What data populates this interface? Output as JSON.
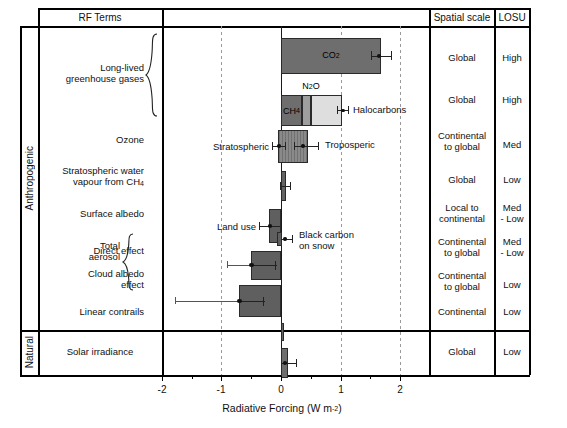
{
  "figure": {
    "columns": {
      "rf_terms": "RF Terms",
      "spatial_scale": "Spatial scale",
      "losu": "LOSU"
    },
    "group_labels": {
      "anthropogenic": "Anthropogenic",
      "natural": "Natural"
    },
    "brace_labels": {
      "llghg": "Long-lived\ngreenhouse gases",
      "llghg_line1": "Long-lived",
      "llghg_line2": "greenhouse gases",
      "total_aerosol_line1": "Total",
      "total_aerosol_line2": "aerosol"
    },
    "axis": {
      "title_main": "Radiative Forcing (W m",
      "title_exp": "-2",
      "title_close": ")",
      "tick_labels": [
        "-2",
        "-1",
        "0",
        "1",
        "2"
      ],
      "tick_values": [
        -2,
        -1,
        0,
        1,
        2
      ],
      "xlim": [
        -2.4,
        2.45
      ],
      "gridlines": [
        -1,
        1,
        2
      ]
    }
  },
  "chart_data": {
    "type": "bar",
    "orientation": "horizontal",
    "title": "",
    "xlabel": "Radiative Forcing (W m-2)",
    "ylabel": "RF Terms",
    "xlim": [
      -2.4,
      2.45
    ],
    "grid": true,
    "legend": "none",
    "rows": [
      {
        "id": "co2",
        "term": "Long-lived greenhouse gases",
        "bar_label": "CO2",
        "bar_label_html": "CO<sub>2</sub>",
        "value": 1.66,
        "err_low": 1.49,
        "err_high": 1.83,
        "err_center": 1.57,
        "spatial_scale": "Global",
        "losu": "High",
        "color": "#6e6e6e"
      },
      {
        "id": "ch4_n2o_halocarbons",
        "term": "Long-lived greenhouse gases",
        "stacked": true,
        "segments": [
          {
            "name": "CH4",
            "label_html": "CH<sub>4</sub>",
            "value": 0.48,
            "color": "#6e6e6e"
          },
          {
            "name": "N2O",
            "label_html": "N<sub>2</sub>O",
            "value": 0.16,
            "color": "#9e9e9e"
          },
          {
            "name": "Halocarbons",
            "label_html": "Halocarbons",
            "value": 0.34,
            "color": "#dedede"
          }
        ],
        "total": 0.98,
        "err_low": 0.92,
        "err_high": 1.12,
        "err_center": 1.02,
        "spatial_scale": "Global",
        "losu": "High"
      },
      {
        "id": "ozone",
        "term": "Ozone",
        "value_low": -0.05,
        "value_high": 0.35,
        "labels": [
          "Stratospheric",
          "Troposperic"
        ],
        "strat_value": -0.05,
        "strat_err_low": -0.15,
        "strat_err_high": 0.05,
        "trop_value": 0.35,
        "trop_err_low": 0.25,
        "trop_err_high": 0.65,
        "spatial_scale": "Continental\nto global",
        "spatial_scale_line1": "Continental",
        "spatial_scale_line2": "to global",
        "losu": "Med"
      },
      {
        "id": "strat_water_vapour",
        "term": "Stratospheric water vapour from CH4",
        "term_line1": "Stratospheric water",
        "term_line2_html": "vapour from CH<sub>4</sub>",
        "value": 0.07,
        "err_low": 0.02,
        "err_high": 0.12,
        "spatial_scale": "Global",
        "losu": "Low"
      },
      {
        "id": "surface_albedo",
        "term": "Surface albedo",
        "labels": [
          "Land use",
          "Black carbon on snow"
        ],
        "label2_line1": "Black carbon",
        "label2_line2": "on snow",
        "land_use_value": -0.2,
        "land_use_err_low": -0.4,
        "land_use_err_high": 0.0,
        "bc_snow_value": 0.1,
        "bc_snow_err_low": 0.0,
        "bc_snow_err_high": 0.2,
        "spatial_scale": "Local to\ncontinental",
        "spatial_scale_line1": "Local to",
        "spatial_scale_line2": "continental",
        "losu": "Med\n- Low",
        "losu_line1": "Med",
        "losu_line2": "- Low"
      },
      {
        "id": "aerosol_direct",
        "term": "Direct effect",
        "group": "Total aerosol",
        "value": -0.5,
        "err_low": -0.9,
        "err_high": -0.1,
        "spatial_scale_line1": "Continental",
        "spatial_scale_line2": "to global",
        "losu_line1": "Med",
        "losu_line2": "- Low"
      },
      {
        "id": "aerosol_cloud_albedo",
        "term": "Cloud albedo effect",
        "term_line1": "Cloud albedo",
        "term_line2": "effect",
        "group": "Total aerosol",
        "value": -0.7,
        "err_low": -1.8,
        "err_high": -0.3,
        "spatial_scale_line1": "Continental",
        "spatial_scale_line2": "to global",
        "losu": "Low"
      },
      {
        "id": "linear_contrails",
        "term": "Linear contrails",
        "value": 0.01,
        "err_low": 0.003,
        "err_high": 0.03,
        "spatial_scale": "Continental",
        "losu": "Low"
      },
      {
        "id": "solar_irradiance",
        "term": "Solar irradiance",
        "group": "Natural",
        "value": 0.12,
        "err_low": 0.06,
        "err_high": 0.3,
        "spatial_scale": "Global",
        "losu": "Low"
      }
    ]
  }
}
